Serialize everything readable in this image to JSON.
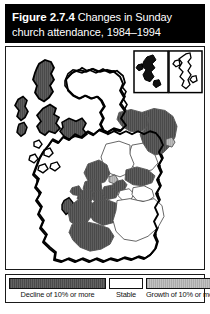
{
  "figure": {
    "number_label": "Figure 2.7.4",
    "title_part1": "Changes in Sunday",
    "title_part2": "church attendance, 1984–1994",
    "header_background": "#000000",
    "header_text_color": "#ffffff",
    "panel_border_color": "#1a1a1a"
  },
  "legend": {
    "items": [
      {
        "key": "decline",
        "label": "Decline of 10% or more",
        "color": "#595959"
      },
      {
        "key": "stable",
        "label": "Stable",
        "color": "#ffffff"
      },
      {
        "key": "growth",
        "label": "Growth of 10% or more",
        "color": "#b3b3b3"
      }
    ]
  },
  "map": {
    "region_name": "Scotland",
    "insets": [
      {
        "name": "Orkney",
        "category": "decline"
      },
      {
        "name": "Shetland",
        "category": "stable"
      }
    ],
    "coastline_color": "#000000",
    "internal_border_color": "#555555",
    "areas": [
      {
        "name": "Western Isles (Lewis and Harris)",
        "category": "decline"
      },
      {
        "name": "Western Isles (Uists and Barra)",
        "category": "decline"
      },
      {
        "name": "Skye",
        "category": "decline"
      },
      {
        "name": "Wester Ross",
        "category": "decline"
      },
      {
        "name": "Highland (north and west)",
        "category": "stable"
      },
      {
        "name": "Caithness",
        "category": "stable"
      },
      {
        "name": "Moray",
        "category": "decline"
      },
      {
        "name": "Aberdeenshire",
        "category": "decline"
      },
      {
        "name": "Aberdeen City",
        "category": "growth"
      },
      {
        "name": "Angus",
        "category": "stable"
      },
      {
        "name": "Perth and Kinross",
        "category": "stable"
      },
      {
        "name": "Stirling",
        "category": "decline"
      },
      {
        "name": "Argyll and Bute",
        "category": "stable"
      },
      {
        "name": "Arran",
        "category": "decline"
      },
      {
        "name": "Dunbartonshire",
        "category": "decline"
      },
      {
        "name": "Glasgow City",
        "category": "decline"
      },
      {
        "name": "Renfrewshire",
        "category": "decline"
      },
      {
        "name": "Inverclyde",
        "category": "decline"
      },
      {
        "name": "North Lanarkshire",
        "category": "decline"
      },
      {
        "name": "South Lanarkshire",
        "category": "decline"
      },
      {
        "name": "Ayrshire",
        "category": "decline"
      },
      {
        "name": "Dumfries and Galloway",
        "category": "decline"
      },
      {
        "name": "Falkirk",
        "category": "decline"
      },
      {
        "name": "Fife",
        "category": "decline"
      },
      {
        "name": "Clackmannanshire",
        "category": "growth"
      },
      {
        "name": "City of Edinburgh",
        "category": "stable"
      },
      {
        "name": "East Lothian",
        "category": "stable"
      },
      {
        "name": "Scottish Borders",
        "category": "stable"
      }
    ]
  }
}
